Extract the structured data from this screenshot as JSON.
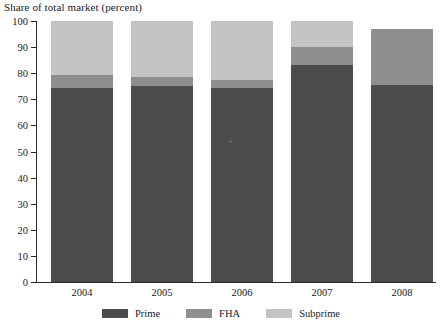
{
  "chart_data": {
    "type": "bar",
    "stacked": true,
    "title": "Share of total market (percent)",
    "xlabel": "",
    "ylabel": "Share of total market (percent)",
    "ylim": [
      0,
      100
    ],
    "yticks": [
      0,
      10,
      20,
      30,
      40,
      50,
      60,
      70,
      80,
      90,
      100
    ],
    "grid": false,
    "legend_position": "bottom",
    "categories": [
      "2004",
      "2005",
      "2006",
      "2007",
      "2008"
    ],
    "series": [
      {
        "name": "Prime",
        "color": "#4c4c4c",
        "values": [
          74.5,
          75.0,
          74.5,
          83.0,
          75.5
        ]
      },
      {
        "name": "FHA",
        "color": "#8e8e8e",
        "values": [
          5.0,
          3.5,
          3.0,
          7.0,
          21.5
        ]
      },
      {
        "name": "Subprime",
        "color": "#c3c3c3",
        "values": [
          20.5,
          21.5,
          22.5,
          10.0,
          0.0
        ]
      }
    ],
    "cumulative_tops": {
      "prime": [
        74.5,
        75.0,
        74.5,
        83.0,
        75.5
      ],
      "fha": [
        79.5,
        78.5,
        77.5,
        90.0,
        97.0
      ],
      "subprime": [
        100.0,
        100.0,
        100.0,
        100.0,
        97.0
      ]
    }
  },
  "axis": {
    "title": "Share of total market (percent)",
    "tick_labels": [
      "100",
      "90",
      "80",
      "70",
      "60",
      "50",
      "40",
      "30",
      "20",
      "10",
      "0"
    ]
  },
  "legend": {
    "items": [
      {
        "label": "Prime",
        "color": "#4c4c4c"
      },
      {
        "label": "FHA",
        "color": "#8e8e8e"
      },
      {
        "label": "Subprime",
        "color": "#c3c3c3"
      }
    ]
  }
}
